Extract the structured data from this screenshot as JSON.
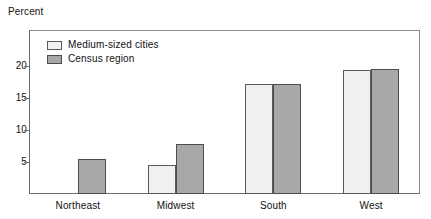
{
  "chart_data": {
    "type": "bar",
    "title": "",
    "subtitle": "",
    "xlabel": "",
    "ylabel": "Percent",
    "categories": [
      "Northeast",
      "Midwest",
      "South",
      "West"
    ],
    "series": [
      {
        "name": "Medium-sized cities",
        "color": "#f0f0f0",
        "values": [
          0,
          4.5,
          17.1,
          19.3
        ]
      },
      {
        "name": "Census region",
        "color": "#a8a8a8",
        "values": [
          5.4,
          7.8,
          17.1,
          19.5
        ]
      }
    ],
    "ylim": [
      0,
      25.6
    ],
    "yticks": [
      5,
      10,
      15,
      20
    ],
    "ytick_labels": [
      "5",
      "10",
      "15",
      "20"
    ],
    "grid": false,
    "legend_position": "top-left",
    "annotations": []
  },
  "axis": {
    "y_title": "Percent"
  },
  "legend": {
    "items": [
      {
        "label": "Medium-sized cities"
      },
      {
        "label": "Census region"
      }
    ]
  },
  "colors": {
    "series_light": "#f0f0f0",
    "series_gray": "#a8a8a8",
    "frame": "#8a8a8a",
    "text": "#111111",
    "background": "#ffffff"
  }
}
